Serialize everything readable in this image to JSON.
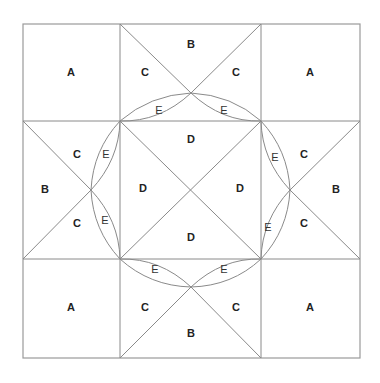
{
  "diagram": {
    "type": "quilt-block-pattern",
    "labels": {
      "A": "A",
      "B": "B",
      "C": "C",
      "D": "D",
      "E": "E"
    },
    "pieces": [
      {
        "id": "a-tl",
        "label": "A",
        "x": 71,
        "y": 73
      },
      {
        "id": "a-tr",
        "label": "A",
        "x": 310,
        "y": 73
      },
      {
        "id": "a-bl",
        "label": "A",
        "x": 71,
        "y": 308
      },
      {
        "id": "a-br",
        "label": "A",
        "x": 310,
        "y": 308
      },
      {
        "id": "b-top",
        "label": "B",
        "x": 191,
        "y": 45
      },
      {
        "id": "b-left",
        "label": "B",
        "x": 45,
        "y": 190
      },
      {
        "id": "b-right",
        "label": "B",
        "x": 336,
        "y": 190
      },
      {
        "id": "b-bottom",
        "label": "B",
        "x": 191,
        "y": 334
      },
      {
        "id": "c-1",
        "label": "C",
        "x": 145,
        "y": 73
      },
      {
        "id": "c-2",
        "label": "C",
        "x": 236,
        "y": 73
      },
      {
        "id": "c-3",
        "label": "C",
        "x": 77,
        "y": 155
      },
      {
        "id": "c-4",
        "label": "C",
        "x": 77,
        "y": 224
      },
      {
        "id": "c-5",
        "label": "C",
        "x": 304,
        "y": 155
      },
      {
        "id": "c-6",
        "label": "C",
        "x": 304,
        "y": 224
      },
      {
        "id": "c-7",
        "label": "C",
        "x": 145,
        "y": 308
      },
      {
        "id": "c-8",
        "label": "C",
        "x": 236,
        "y": 308
      },
      {
        "id": "d-top",
        "label": "D",
        "x": 191,
        "y": 140
      },
      {
        "id": "d-left",
        "label": "D",
        "x": 143,
        "y": 189
      },
      {
        "id": "d-right",
        "label": "D",
        "x": 240,
        "y": 189
      },
      {
        "id": "d-bottom",
        "label": "D",
        "x": 191,
        "y": 238
      },
      {
        "id": "e-1",
        "label": "E",
        "x": 159,
        "y": 111
      },
      {
        "id": "e-2",
        "label": "E",
        "x": 224,
        "y": 111
      },
      {
        "id": "e-3",
        "label": "E",
        "x": 106,
        "y": 155
      },
      {
        "id": "e-4",
        "label": "E",
        "x": 105,
        "y": 221
      },
      {
        "id": "e-5",
        "label": "E",
        "x": 275,
        "y": 158
      },
      {
        "id": "e-6",
        "label": "E",
        "x": 268,
        "y": 228
      },
      {
        "id": "e-7",
        "label": "E",
        "x": 155,
        "y": 270
      },
      {
        "id": "e-8",
        "label": "E",
        "x": 224,
        "y": 270
      }
    ]
  }
}
